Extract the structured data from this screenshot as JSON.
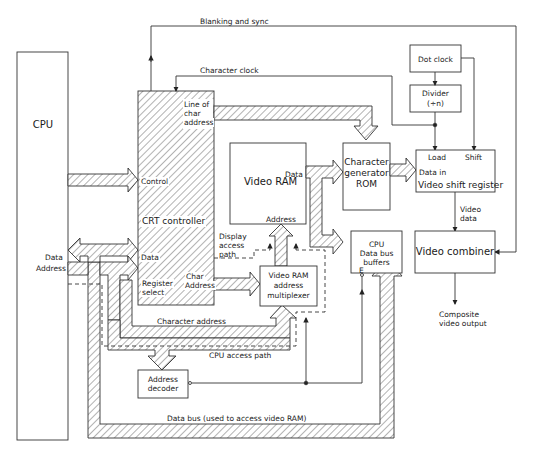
{
  "diagram": {
    "type": "block-diagram",
    "colors": {
      "line": "#333333",
      "hatch": "#555555",
      "background": "#ffffff"
    },
    "blocks": {
      "cpu": {
        "label": "CPU"
      },
      "crt_controller": {
        "label": "CRT controller",
        "ports": {
          "line_of_char_1": "Line of",
          "line_of_char_2": "char",
          "line_of_char_3": "address",
          "control": "Control",
          "data": "Data",
          "register_1": "Register",
          "register_2": "select",
          "char_addr_1": "Char",
          "char_addr_2": "Address"
        }
      },
      "video_ram": {
        "label": "Video RAM",
        "port_data": "Data",
        "port_address": "Address"
      },
      "char_gen_rom": {
        "line1": "Character",
        "line2": "generator",
        "line3": "ROM"
      },
      "dot_clock": {
        "label": "Dot clock"
      },
      "divider": {
        "line1": "Divider",
        "line2": "(÷n)"
      },
      "video_shift_register": {
        "label": "Video shift register",
        "port_load": "Load",
        "port_shift": "Shift",
        "port_data_in": "Data in"
      },
      "cpu_data_bus_buffers": {
        "line1": "CPU",
        "line2": "Data bus",
        "line3": "buffers",
        "enable": "E"
      },
      "video_combiner": {
        "label": "Video combiner"
      },
      "video_ram_address_mux": {
        "line1": "Video RAM",
        "line2": "address",
        "line3": "multiplexer"
      },
      "address_decoder": {
        "line1": "Address",
        "line2": "decoder"
      }
    },
    "signals": {
      "blanking_sync": "Blanking and sync",
      "character_clock": "Character clock",
      "video_data_1": "Video",
      "video_data_2": "data",
      "composite_1": "Composite",
      "composite_2": "video output",
      "cpu_data": "Data",
      "cpu_address": "Address",
      "display_access_1": "Display",
      "display_access_2": "access",
      "display_access_3": "path",
      "character_address": "Character address",
      "cpu_access_path": "CPU access path",
      "data_bus": "Data bus (used to access video RAM)"
    }
  }
}
